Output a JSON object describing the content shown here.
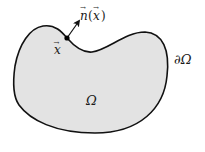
{
  "diagram": {
    "region_label": "Ω",
    "boundary_label": "∂Ω",
    "point_label": "x",
    "point_vector_mark": "→",
    "normal_label_n": "n",
    "normal_label_open": "(",
    "normal_label_x": "x",
    "normal_label_close": ")",
    "colors": {
      "region_fill": "#e3e3e3",
      "boundary_stroke": "#111111",
      "point": "#000000",
      "text": "#1a1a1a"
    }
  }
}
